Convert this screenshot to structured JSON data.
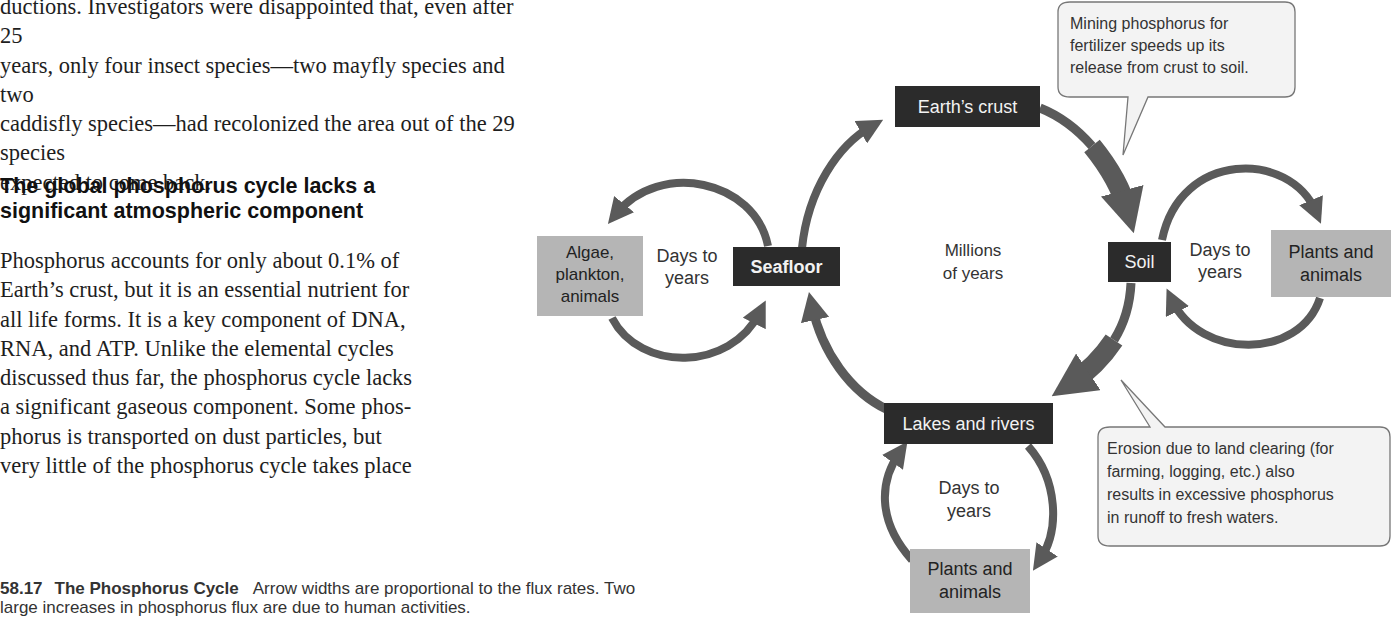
{
  "text_column": {
    "paragraph_1_lines": [
      "ductions. Investigators were disappointed that, even after 25",
      "years, only four insect species—two mayfly species and two",
      "caddisfly species—had recolonized the area out of the 29 species",
      "expected to come back."
    ],
    "heading_lines": [
      "The global phosphorus cycle lacks a",
      "significant atmospheric component"
    ],
    "paragraph_2_lines": [
      "Phosphorus accounts for only about 0.1% of",
      "Earth’s crust, but it is an essential nutrient for",
      "all life forms. It is a key component of DNA,",
      "RNA, and ATP. Unlike the elemental cycles",
      "discussed thus far, the phosphorus cycle lacks",
      "a significant gaseous component. Some phos-",
      "phorus is transported on dust particles, but",
      "very little of the phosphorus cycle takes place"
    ]
  },
  "figure": {
    "number": "58.17",
    "title": "The Phosphorus Cycle",
    "caption_line_1": "Arrow widths are proportional to the flux rates. Two",
    "caption_line_2": "large increases in phosphorus flux are due to human activities."
  },
  "diagram": {
    "colors": {
      "reservoir_dark": "#2b2b2b",
      "reservoir_light": "#b5b5b5",
      "arrow": "#5a5a5a",
      "callout_fill": "#f3f3f3",
      "callout_stroke": "#777777"
    },
    "reservoirs": {
      "earths_crust": "Earth’s crust",
      "seafloor": "Seafloor",
      "soil": "Soil",
      "lakes_rivers": "Lakes and rivers",
      "algae_lines": [
        "Algae,",
        "plankton,",
        "animals"
      ],
      "plants_right_lines": [
        "Plants and",
        "animals"
      ],
      "plants_bottom_lines": [
        "Plants and",
        "animals"
      ]
    },
    "timescales": {
      "main_cycle_lines": [
        "Millions",
        "of years"
      ],
      "ocean_cycle_lines": [
        "Days to",
        "years"
      ],
      "soil_cycle_lines": [
        "Days to",
        "years"
      ],
      "freshwater_cycle_lines": [
        "Days to",
        "years"
      ]
    },
    "callouts": {
      "mining_lines": [
        "Mining phosphorus for",
        "fertilizer speeds up its",
        "release from crust to soil."
      ],
      "erosion_lines": [
        "Erosion due to land clearing (for",
        "farming, logging, etc.) also",
        "results in excessive phosphorus",
        "in runoff to fresh waters."
      ]
    }
  }
}
